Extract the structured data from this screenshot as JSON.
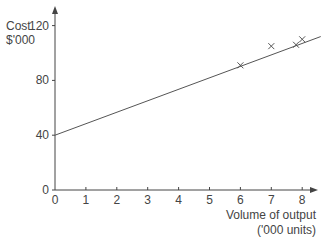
{
  "chart_data": {
    "type": "scatter",
    "title": "",
    "ylabel": "Cost $'000",
    "ylabel_lines": [
      "Cost",
      "$'000"
    ],
    "xlabel": "Volume of output ('000 units)",
    "xlabel_lines": [
      "Volume of output",
      "('000 units)"
    ],
    "xlim": [
      0,
      8.7
    ],
    "ylim": [
      0,
      125
    ],
    "x_ticks": [
      0,
      1,
      2,
      3,
      4,
      5,
      6,
      7,
      8
    ],
    "y_ticks": [
      0,
      40,
      80,
      120
    ],
    "grid": false,
    "legend": null,
    "series": [
      {
        "name": "observations",
        "marker": "x",
        "points": [
          {
            "x": 6.0,
            "y": 91
          },
          {
            "x": 7.0,
            "y": 105
          },
          {
            "x": 7.8,
            "y": 106
          },
          {
            "x": 8.0,
            "y": 110
          }
        ]
      },
      {
        "name": "line of best fit",
        "type": "line",
        "intercept": 40,
        "slope": 8.4,
        "points": [
          {
            "x": 0,
            "y": 40
          },
          {
            "x": 8.6,
            "y": 112
          }
        ]
      }
    ],
    "colors": {
      "axis": "#444444",
      "line": "#555555",
      "marker": "#555555"
    }
  }
}
